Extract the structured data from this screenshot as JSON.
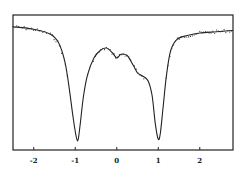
{
  "chart_data": {
    "type": "line",
    "title": "",
    "xlabel": "",
    "ylabel": "",
    "xlim": [
      -2.5,
      2.8
    ],
    "ylim": [
      0,
      1
    ],
    "grid": false,
    "legend": null,
    "x_ticks": [
      -2,
      -1,
      0,
      1,
      2
    ],
    "x_tick_labels": [
      "-2",
      "-1",
      "0",
      "1",
      "2"
    ],
    "series": [
      {
        "name": "fit",
        "style": "solid line",
        "x": [
          -2.5,
          -2.0,
          -1.6,
          -1.4,
          -1.25,
          -1.15,
          -1.05,
          -0.97,
          -0.93,
          -0.88,
          -0.8,
          -0.7,
          -0.55,
          -0.4,
          -0.25,
          -0.1,
          0.0,
          0.1,
          0.25,
          0.4,
          0.5,
          0.6,
          0.75,
          0.85,
          0.93,
          1.0,
          1.05,
          1.12,
          1.2,
          1.3,
          1.45,
          1.7,
          2.0,
          2.4,
          2.8
        ],
        "y": [
          0.93,
          0.91,
          0.87,
          0.8,
          0.65,
          0.45,
          0.2,
          0.04,
          0.03,
          0.15,
          0.38,
          0.55,
          0.68,
          0.74,
          0.76,
          0.72,
          0.68,
          0.71,
          0.7,
          0.62,
          0.56,
          0.54,
          0.5,
          0.38,
          0.15,
          0.03,
          0.08,
          0.3,
          0.55,
          0.74,
          0.83,
          0.86,
          0.88,
          0.89,
          0.9
        ]
      },
      {
        "name": "data points",
        "style": "scattered dots along fit"
      }
    ],
    "annotations": []
  }
}
